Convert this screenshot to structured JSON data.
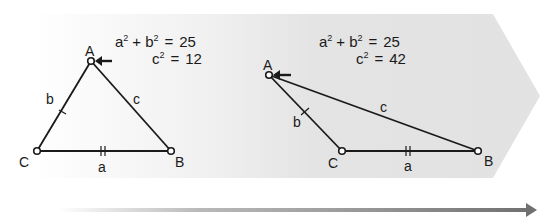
{
  "diagram": {
    "type": "law-of-cosines-progression",
    "background": {
      "shape": "right-pointing-chevron-band",
      "color": "#e6e6e6",
      "fade_from_left": true
    },
    "progress_arrow": {
      "color": "#7a7a7a",
      "direction": "right",
      "fade_from_left": true
    },
    "panels": [
      {
        "name": "acute-triangle",
        "equation_line1": {
          "a": "a",
          "plus": "+",
          "b": "b",
          "exp": "2",
          "equals": "=",
          "value": "25"
        },
        "equation_line2": {
          "c": "c",
          "exp": "2",
          "equals": "=",
          "value": "12"
        },
        "vertices": {
          "A": "A",
          "B": "B",
          "C": "C"
        },
        "sides": {
          "a": "a",
          "b": "b",
          "c": "c"
        },
        "arrow_at": "A",
        "tick_marks": {
          "a": 2,
          "b": 1
        }
      },
      {
        "name": "obtuse-triangle",
        "equation_line1": {
          "a": "a",
          "plus": "+",
          "b": "b",
          "exp": "2",
          "equals": "=",
          "value": "25"
        },
        "equation_line2": {
          "c": "c",
          "exp": "2",
          "equals": "=",
          "value": "42"
        },
        "vertices": {
          "A": "A",
          "B": "B",
          "C": "C"
        },
        "sides": {
          "a": "a",
          "b": "b",
          "c": "c"
        },
        "arrow_at": "A",
        "tick_marks": {
          "a": 2,
          "b": 1
        }
      }
    ]
  }
}
